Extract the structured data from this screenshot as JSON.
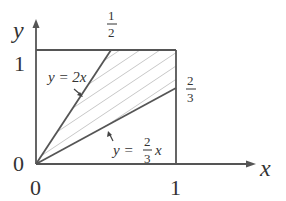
{
  "diagram": {
    "type": "region-plot",
    "axes": {
      "x_label": "x",
      "y_label": "y",
      "origin_x_tick": "0",
      "origin_y_tick": "0",
      "x_tick_1": "1",
      "y_tick_1": "1"
    },
    "box": {
      "x_max": 1,
      "y_max": 1
    },
    "lines": [
      {
        "equation_lhs": "y = 2x",
        "label": "y = 2x",
        "slope": 2,
        "end_label_num": "1",
        "end_label_den": "2"
      },
      {
        "equation_lhs": "y =",
        "frac_num": "2",
        "frac_den": "3",
        "var": "x",
        "slope": 0.6667,
        "end_label_num": "2",
        "end_label_den": "3"
      }
    ],
    "shaded_region": "between y = 2x and y = (2/3)x within unit square",
    "colors": {
      "axis": "#555555",
      "line": "#555555",
      "hatch": "#c8c8c8",
      "text": "#333333"
    }
  }
}
